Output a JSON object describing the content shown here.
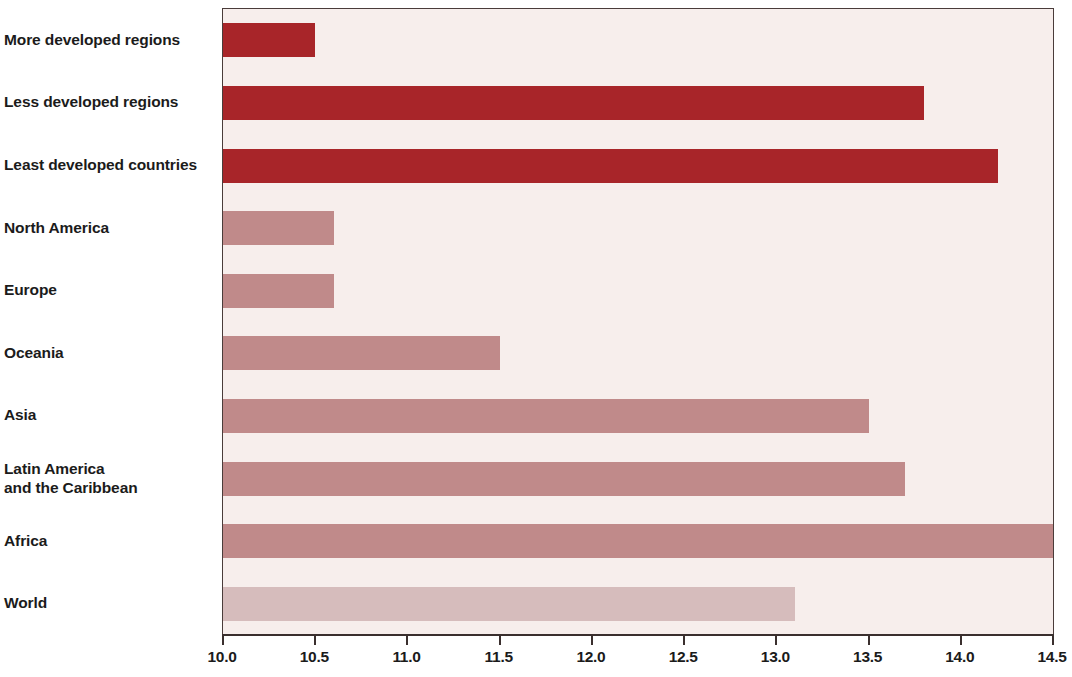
{
  "chart_data": {
    "type": "bar",
    "orientation": "horizontal",
    "title": "",
    "subtitle": "",
    "xlabel": "",
    "ylabel": "",
    "xlim": [
      10.0,
      14.5
    ],
    "xtick_labels": [
      "10.0",
      "10.5",
      "11.0",
      "11.5",
      "12.0",
      "12.5",
      "13.0",
      "13.5",
      "14.0",
      "14.5"
    ],
    "xticks": [
      10.0,
      10.5,
      11.0,
      11.5,
      12.0,
      12.5,
      13.0,
      13.5,
      14.0,
      14.5
    ],
    "grid": false,
    "legend": false,
    "categories": [
      "More developed regions",
      "Less developed regions",
      "Least developed countries",
      "North America",
      "Europe",
      "Oceania",
      "Asia",
      "Latin America\nand the Caribbean",
      "Africa",
      "World"
    ],
    "values": [
      10.5,
      13.8,
      14.2,
      10.6,
      10.6,
      11.5,
      13.5,
      13.7,
      14.6,
      13.1
    ],
    "bar_colors": [
      "#a82529",
      "#a82529",
      "#a82529",
      "#c08a8a",
      "#c08a8a",
      "#c08a8a",
      "#c08a8a",
      "#c08a8a",
      "#c08a8a",
      "#d6bcbc"
    ],
    "notes": {
      "africa_clipped": "Africa bar extends to the right edge of the plot area",
      "plot_background": "#f7eeec",
      "axis_color": "#3a2f2e",
      "dark_series_color": "#a82529",
      "mid_series_color": "#c08a8a",
      "light_series_color": "#d6bcbc"
    }
  }
}
